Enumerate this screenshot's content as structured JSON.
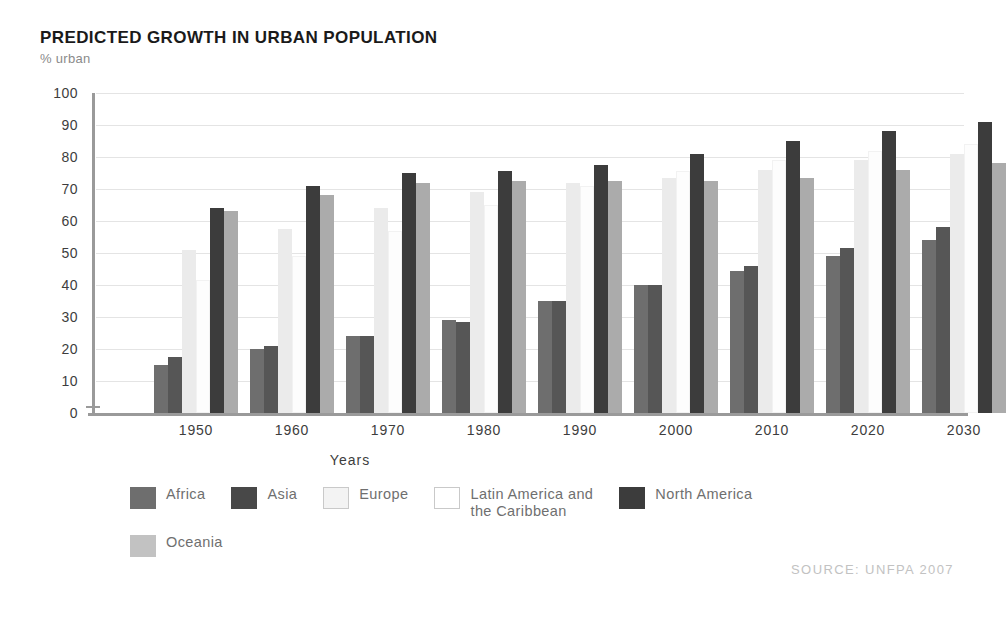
{
  "chart_data": {
    "type": "bar",
    "title": "PREDICTED GROWTH IN URBAN POPULATION",
    "subtitle": "% urban",
    "xlabel": "Years",
    "ylabel": "% urban",
    "ylim": [
      0,
      100
    ],
    "ytick_step": 10,
    "yticks": [
      100,
      90,
      80,
      70,
      60,
      50,
      40,
      30,
      20,
      10,
      0
    ],
    "grid": true,
    "legend_position": "bottom",
    "source": "SOURCE: UNFPA 2007",
    "categories": [
      "1950",
      "1960",
      "1970",
      "1980",
      "1990",
      "2000",
      "2010",
      "2020",
      "2030"
    ],
    "series": [
      {
        "name": "Africa",
        "color": "#6e6e6e",
        "values": [
          15,
          20,
          24,
          29,
          35,
          40,
          44.5,
          49,
          54
        ]
      },
      {
        "name": "Asia",
        "color": "#565656",
        "values": [
          17.5,
          21,
          24,
          28.5,
          35,
          40,
          46,
          51.5,
          58
        ]
      },
      {
        "name": "Europe",
        "color": "#ebebeb",
        "values": [
          51,
          57.5,
          64,
          69,
          72,
          73.5,
          76,
          79,
          81
        ]
      },
      {
        "name": "Latin America and\nthe Caribbean",
        "color": "#fdfdfd",
        "values": [
          41.5,
          49,
          57,
          65,
          71,
          75.5,
          79,
          82,
          84
        ]
      },
      {
        "name": "North America",
        "color": "#3c3c3c",
        "values": [
          64,
          71,
          75,
          75.5,
          77.5,
          81,
          85,
          88,
          91
        ]
      },
      {
        "name": "Oceania",
        "color": "#ababab",
        "values": [
          63,
          68,
          72,
          72.5,
          72.5,
          72.5,
          73.5,
          76,
          78
        ]
      }
    ]
  },
  "legend": {
    "items": [
      {
        "label": "Africa",
        "swatch": "africa"
      },
      {
        "label": "Asia",
        "swatch": "asia"
      },
      {
        "label": "Europe",
        "swatch": "europe"
      },
      {
        "label": "Latin America and\nthe Caribbean",
        "swatch": "latin"
      },
      {
        "label": "North America",
        "swatch": "north"
      },
      {
        "label": "Oceania",
        "swatch": "oceania"
      }
    ]
  }
}
